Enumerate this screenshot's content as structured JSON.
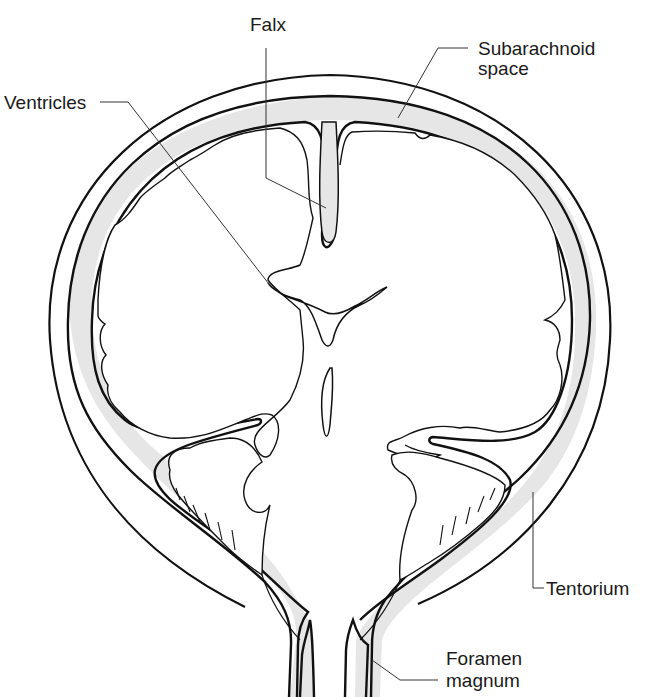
{
  "figure": {
    "colors": {
      "line": "#111111",
      "csf_fill": "#e6e6e6",
      "background": "#ffffff"
    }
  },
  "labels": {
    "falx": "Falx",
    "subarachnoid_line1": "Subarachnoid",
    "subarachnoid_line2": "space",
    "ventricles": "Ventricles",
    "tentorium": "Tentorium",
    "foramen_line1": "Foramen",
    "foramen_line2": "magnum"
  }
}
